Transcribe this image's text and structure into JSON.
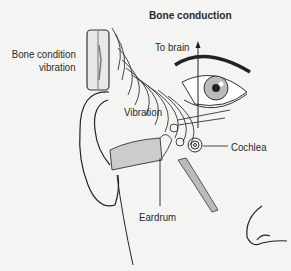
{
  "figure": {
    "title": "Bone conduction",
    "labels": {
      "device": [
        "Bone condition",
        "vibration"
      ],
      "to_brain": "To brain",
      "vibration": "Vibration",
      "cochlea": "Cochlea",
      "eardrum": "Eardrum"
    },
    "parts": [
      "bone-conduction-device",
      "sound-waves",
      "ear",
      "ear-canal",
      "eardrum",
      "ossicles",
      "cochlea",
      "auditory-nerve",
      "eye",
      "eyebrow",
      "nose"
    ]
  }
}
